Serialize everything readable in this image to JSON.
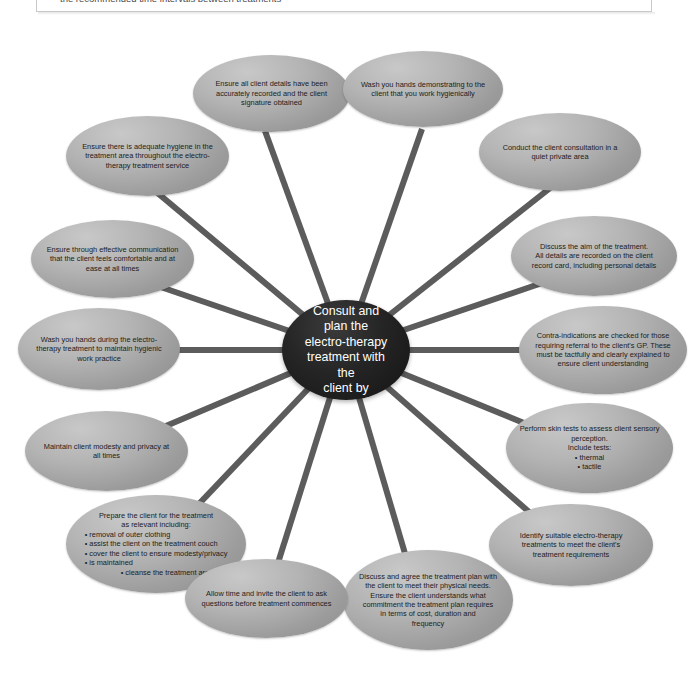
{
  "top_note": {
    "bullet_text": "the recommended time intervals between treatments"
  },
  "diagram": {
    "type": "spider-web / mind-map",
    "center": {
      "label": "Consult and plan the\nelectro-therapy\ntreatment with the\nclient by"
    },
    "nodes": [
      {
        "id": "client-details",
        "label": "Ensure all client details have been\naccurately recorded and the client\nsignature obtained"
      },
      {
        "id": "wash-hands-demonstrate",
        "label": "Wash you hands demonstrating to the\nclient that you work hygienically"
      },
      {
        "id": "quiet-private-area",
        "label": "Conduct the client consultation in a\nquiet private area"
      },
      {
        "id": "adequate-hygiene",
        "label": "Ensure there is adequate hygiene in the\ntreatment area throughout the electro-\ntherapy treatment service"
      },
      {
        "id": "discuss-aim",
        "label": "Discuss the aim of the treatment.\nAll details are recorded on the client\nrecord card, including personal details"
      },
      {
        "id": "effective-communication",
        "label": "Ensure through effective communication\nthat the client feels comfortable and at\nease at all times"
      },
      {
        "id": "contra-indications",
        "label": "Contra-indications are checked for those\nrequiring referral to the client's GP. These\nmust be tactfully and clearly explained to\nensure client understanding"
      },
      {
        "id": "wash-hands-during",
        "label": "Wash you hands during the electro-\ntherapy treatment to maintain hygienic\nwork practice"
      },
      {
        "id": "skin-tests",
        "label": "Perform skin tests to assess client sensory\nperception.\nInclude tests:",
        "bullets": [
          "thermal",
          "tactile"
        ],
        "bullets_centered": true
      },
      {
        "id": "modesty-privacy",
        "label": "Maintain client modesty and privacy at\nall times"
      },
      {
        "id": "identify-treatments",
        "label": "Identify suitable electro-therapy\ntreatments to meet the client's\ntreatment requirements"
      },
      {
        "id": "prepare-client",
        "label": "Prepare the client for the treatment\nas relevant including:",
        "bullets": [
          "removal of outer clothing",
          "assist the client on the treatment couch",
          "cover the client to ensure modesty/privacy",
          "is maintained"
        ],
        "bullets_tail": "cleanse the treatment area"
      },
      {
        "id": "treatment-plan",
        "label": "Discuss and agree the treatment plan with\nthe client to meet their physical needs.\nEnsure the client understands what\ncommitment the treatment plan requires\nin terms of cost, duration and\nfrequency"
      },
      {
        "id": "allow-questions",
        "label": "Allow time and invite the client to ask\nquestions before treatment commences"
      }
    ],
    "colors": {
      "spoke": "#5c5c5c",
      "node_fill_light": "#c8c8c8",
      "node_fill_dark": "#8d8d8d",
      "center_fill": "#141414",
      "center_text": "#ffffff",
      "node_text": "#1c1c1c",
      "background": "#ffffff"
    }
  }
}
